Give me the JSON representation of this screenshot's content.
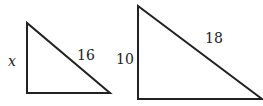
{
  "diagram": {
    "stroke_color": "#222222",
    "small_triangle": {
      "leg_label": "x",
      "hypotenuse_label": "16"
    },
    "large_triangle": {
      "leg_label": "10",
      "hypotenuse_label": "18"
    }
  }
}
